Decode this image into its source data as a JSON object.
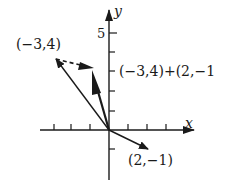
{
  "diagram": {
    "type": "vector-addition",
    "axes": {
      "x_label": "x",
      "y_label": "y",
      "y_tick_label": "5",
      "origin": [
        0,
        0
      ]
    },
    "vectors": [
      {
        "name": "u",
        "label": "(−3,4)",
        "components": [
          -3,
          4
        ],
        "style": "thin-arrow"
      },
      {
        "name": "v",
        "label": "(2,−1)",
        "components": [
          2,
          -1
        ],
        "style": "thin-arrow"
      },
      {
        "name": "sum",
        "label": "(−3,4)+(2,−1",
        "components": [
          -1,
          3
        ],
        "style": "thick-arrow"
      }
    ],
    "translated_vector": {
      "from": [
        -3,
        4
      ],
      "to": [
        -1,
        3
      ],
      "style": "dashed-arrow"
    },
    "colors": {
      "ink": "#1a1a1a",
      "background": "#ffffff"
    }
  }
}
